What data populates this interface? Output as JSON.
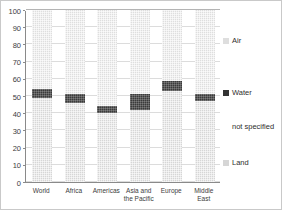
{
  "chart_data": {
    "type": "bar",
    "subtype": "stacked-bar",
    "title": "",
    "subtitle": "",
    "xlabel": "",
    "ylabel": "",
    "ylim": [
      0,
      100
    ],
    "yticks": [
      0,
      10,
      20,
      30,
      40,
      50,
      60,
      70,
      80,
      90,
      100
    ],
    "ytick_labels": [
      "0",
      "10",
      "20",
      "30",
      "40",
      "50",
      "60",
      "70",
      "80",
      "90",
      "100"
    ],
    "grid": true,
    "grid_axis": "y",
    "legend_position": "right",
    "categories": [
      "World",
      "Africa",
      "Americas",
      "Asia and the Pacific",
      "Europe",
      "Middle East"
    ],
    "series": [
      {
        "name": "Land",
        "color": "#d6d6d6",
        "values": [
          49,
          46,
          40,
          42,
          53,
          47
        ]
      },
      {
        "name": "Water",
        "color": "#333333",
        "values": [
          5,
          5,
          4,
          9,
          6,
          4
        ]
      },
      {
        "name": "not specified",
        "color": "#ffffff",
        "values": [
          0,
          0,
          0,
          0,
          0,
          0
        ]
      },
      {
        "name": "Air",
        "color": "#dedede",
        "values": [
          46,
          49,
          56,
          49,
          41,
          49
        ]
      }
    ],
    "legend_entries": [
      {
        "label": "Air",
        "color": "#dedede",
        "swatch": "sw-air"
      },
      {
        "label": "Water",
        "color": "#333333",
        "swatch": "sw-water"
      },
      {
        "label": "not specified",
        "color": "#ffffff",
        "swatch": "sw-unspecified"
      },
      {
        "label": "Land",
        "color": "#d6d6d6",
        "swatch": "sw-land"
      }
    ]
  }
}
